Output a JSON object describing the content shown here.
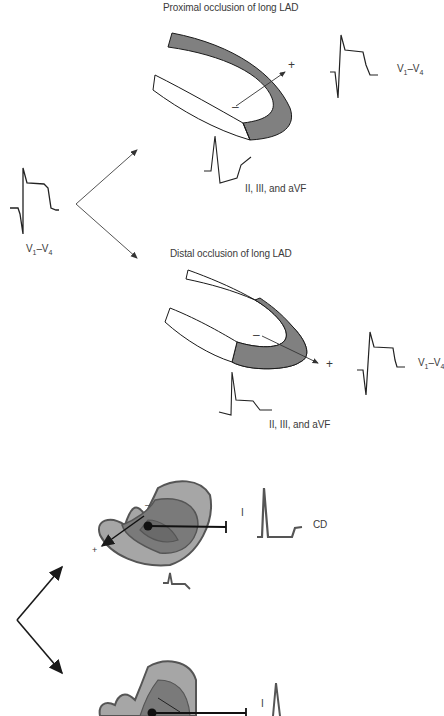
{
  "panel_a": {
    "source_lead": {
      "label_main": "V",
      "sub1": "1",
      "dash": "–",
      "label2": "V",
      "sub2": "4"
    },
    "proximal": {
      "title": "Proximal occlusion of long LAD",
      "vector_plus": "+",
      "vector_minus": "–",
      "precordial_lead": {
        "label_main": "V",
        "sub1": "1",
        "dash": "–",
        "label2": "V",
        "sub2": "4"
      },
      "inferior_leads": "II, III, and aVF"
    },
    "distal": {
      "title": "Distal occlusion of long LAD",
      "vector_plus": "+",
      "vector_minus": "–",
      "precordial_lead": {
        "label_main": "V",
        "sub1": "1",
        "dash": "–",
        "label2": "V",
        "sub2": "4"
      },
      "inferior_leads": "II, III, and aVF"
    }
  },
  "panel_b": {
    "top": {
      "lead_label": "I",
      "segment_label": "CD",
      "vector_minus": "–",
      "vector_plus": "+"
    },
    "bottom": {
      "lead_label": "I"
    }
  },
  "colors": {
    "infarct_fill": "#808080",
    "outline": "#1a1a1a",
    "heart_outer": "#a6a6a6",
    "heart_inner": "#6e6e6e",
    "heart_stroke": "#555555",
    "text": "#3a3a3a"
  }
}
